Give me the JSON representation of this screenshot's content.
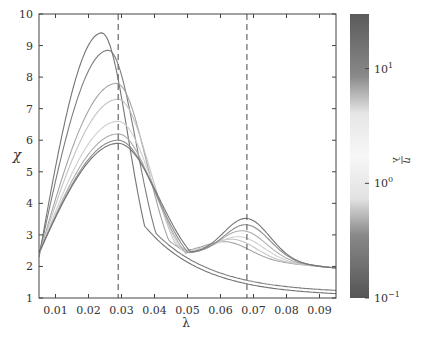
{
  "chart_data": {
    "type": "line",
    "title": "",
    "xlabel": "λ",
    "ylabel": "χ",
    "xlim": [
      0.005,
      0.095
    ],
    "ylim": [
      1,
      10
    ],
    "xticks": [
      "0.01",
      "0.02",
      "0.03",
      "0.04",
      "0.05",
      "0.06",
      "0.07",
      "0.08",
      "0.09"
    ],
    "yticks": [
      "1",
      "2",
      "3",
      "4",
      "5",
      "6",
      "7",
      "8",
      "9",
      "10"
    ],
    "grid": false,
    "vlines": [
      {
        "x": 0.029,
        "style": "dashed"
      },
      {
        "x": 0.068,
        "style": "dashed"
      }
    ],
    "colorbar": {
      "label_num": "η",
      "label_den": "λ",
      "scale": "log",
      "range": [
        0.1,
        30
      ],
      "ticks": [
        {
          "value": 0.1,
          "label_base": "10",
          "label_exp": "−1"
        },
        {
          "value": 1,
          "label_base": "10",
          "label_exp": "0"
        },
        {
          "value": 10,
          "label_base": "10",
          "label_exp": "1"
        }
      ],
      "colormap": "dark-gray → white (at ~2) → dark-gray"
    },
    "series": [
      {
        "name": "eta/lambda=0.1",
        "peak1": {
          "x": 0.024,
          "y": 9.4
        },
        "tail_end": 1.05,
        "second_peak": null,
        "shade": 0.35
      },
      {
        "name": "eta/lambda=0.2",
        "peak1": {
          "x": 0.026,
          "y": 8.85
        },
        "tail_end": 1.15,
        "second_peak": null,
        "shade": 0.4
      },
      {
        "name": "eta/lambda=0.5",
        "peak1": {
          "x": 0.0285,
          "y": 7.8
        },
        "tail_end": 1.35,
        "second_peak": {
          "x": 0.062,
          "y": 2.9
        },
        "shade": 0.65
      },
      {
        "name": "eta/lambda=1",
        "peak1": {
          "x": 0.029,
          "y": 7.3
        },
        "tail_end": 1.5,
        "second_peak": {
          "x": 0.064,
          "y": 3.0
        },
        "shade": 0.85
      },
      {
        "name": "eta/lambda=2",
        "peak1": {
          "x": 0.029,
          "y": 6.6
        },
        "tail_end": 1.6,
        "second_peak": {
          "x": 0.066,
          "y": 3.1
        },
        "shade": 0.92
      },
      {
        "name": "eta/lambda=5",
        "peak1": {
          "x": 0.029,
          "y": 6.2
        },
        "tail_end": 1.6,
        "second_peak": {
          "x": 0.067,
          "y": 3.3
        },
        "shade": 0.7
      },
      {
        "name": "eta/lambda=10",
        "peak1": {
          "x": 0.029,
          "y": 6.0
        },
        "tail_end": 1.6,
        "second_peak": {
          "x": 0.068,
          "y": 3.5
        },
        "shade": 0.5
      },
      {
        "name": "eta/lambda=30",
        "peak1": {
          "x": 0.029,
          "y": 5.9
        },
        "tail_end": 1.6,
        "second_peak": {
          "x": 0.068,
          "y": 3.7
        },
        "shade": 0.35
      }
    ]
  }
}
